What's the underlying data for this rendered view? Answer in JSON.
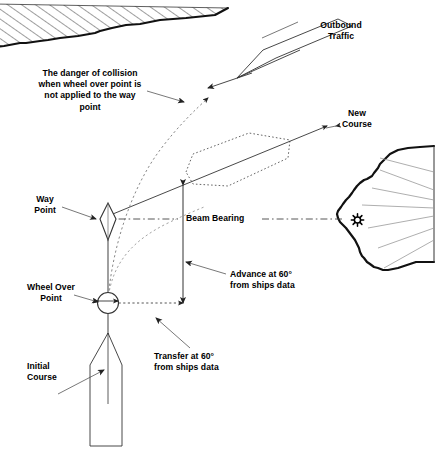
{
  "diagram": {
    "colors": {
      "ink": "#000000",
      "coast_line": "#1a1a1a",
      "thin_line": "#555555",
      "dotted_ship": "#555555",
      "hatch": "#333333",
      "background": "#ffffff"
    },
    "labels": {
      "danger_note": "The danger of collision\nwhen wheel over point is\nnot applied to the way\npoint",
      "outbound_traffic": "Outbound\nTraffic",
      "new_course": "New\nCourse",
      "way_point": "Way\nPoint",
      "beam_bearing": "Beam Bearing",
      "wheel_over_point": "Wheel Over\nPoint",
      "advance": "Advance at 60°\nfrom ships data",
      "transfer": "Transfer at 60°\nfrom ships data",
      "initial_course": "Initial\nCourse"
    },
    "values": {
      "turn_angle": "60°"
    },
    "symbols": {
      "way_point": "diamond-waypoint-symbol",
      "wheel_over_point": "circle-wheel-over-symbol",
      "lighthouse": "lighthouse-beacon-star",
      "shoal": "hatched-shoal-area",
      "headland": "headland-coastline"
    }
  }
}
